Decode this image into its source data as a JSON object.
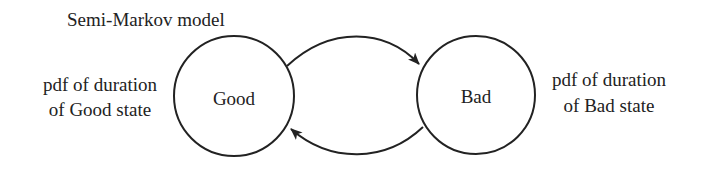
{
  "title": "Semi-Markov model",
  "states": [
    {
      "id": "good",
      "label": "Good",
      "annotation_line1": "pdf of duration",
      "annotation_line2": "of Good state"
    },
    {
      "id": "bad",
      "label": "Bad",
      "annotation_line1": "pdf of duration",
      "annotation_line2": "of Bad state"
    }
  ],
  "transitions": [
    {
      "from": "Good",
      "to": "Bad"
    },
    {
      "from": "Bad",
      "to": "Good"
    }
  ],
  "colors": {
    "stroke": "#222222",
    "background": "#ffffff"
  }
}
